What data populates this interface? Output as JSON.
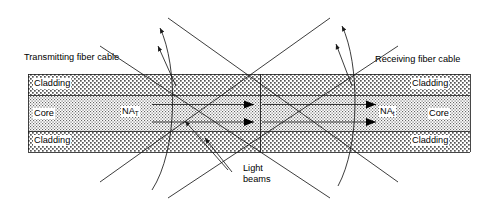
{
  "figure": {
    "type": "technical-diagram",
    "width": 498,
    "height": 215,
    "background": "#ffffff",
    "line_color": "#1a1a1a",
    "text_color": "#000000"
  },
  "labels": {
    "transmitting_cable": "Transmitting fiber cable",
    "receiving_cable": "Receiving fiber cable",
    "light_beams_line1": "Light",
    "light_beams_line2": "beams",
    "na_transmit_base": "NA",
    "na_transmit_sub": "T",
    "na_receive_base": "NA",
    "na_receive_sub": "t"
  },
  "bands": {
    "left": [
      {
        "name": "Cladding",
        "label": "Cladding",
        "fill": "cladding-pattern"
      },
      {
        "name": "Core",
        "label": "Core",
        "fill": "core-pattern"
      },
      {
        "name": "Cladding",
        "label": "Cladding",
        "fill": "cladding-pattern"
      }
    ],
    "right": [
      {
        "name": "Cladding",
        "label": "Cladding",
        "fill": "cladding-pattern"
      },
      {
        "name": "Core",
        "label": "Core",
        "fill": "core-pattern"
      },
      {
        "name": "Cladding",
        "label": "Cladding",
        "fill": "cladding-pattern"
      }
    ]
  },
  "geometry": {
    "fiber_left_x": 28,
    "fiber_right_x": 470,
    "center_x": 260,
    "band_top_y": 74,
    "clad_top_bottom_y": 95,
    "core_bottom_y": 131,
    "band_bottom_y": 152
  },
  "icons": {
    "ray_arrowhead": "triangle-right-arrowhead",
    "leader_arrowhead": "small-arrow",
    "acceptance_arc": "arc"
  }
}
